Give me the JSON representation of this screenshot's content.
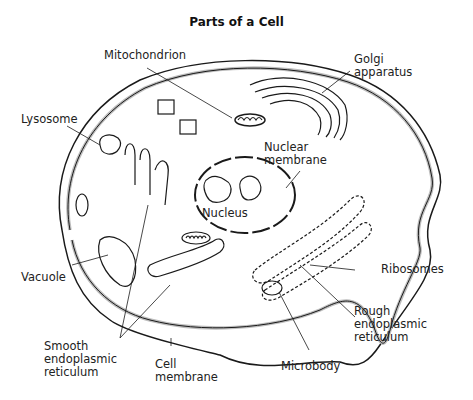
{
  "title": "Parts of a Cell",
  "labels": {
    "mitochondrion": "Mitochondrion",
    "golgi_1": "Golgi",
    "golgi_2": "apparatus",
    "lysosome": "Lysosome",
    "nuclear_membrane_1": "Nuclear",
    "nuclear_membrane_2": "membrane",
    "nucleus": "Nucleus",
    "ribosomes": "Ribosomes",
    "vacuole": "Vacuole",
    "rough_er_1": "Rough",
    "rough_er_2": "endoplasmic",
    "rough_er_3": "reticulum",
    "smooth_er_1": "Smooth",
    "smooth_er_2": "endoplasmic",
    "smooth_er_3": "reticulum",
    "cell_membrane_1": "Cell",
    "cell_membrane_2": "membrane",
    "microbody": "Microbody"
  },
  "colors": {
    "line": "#1a1a1a",
    "membrane_fill": "#bdbdbd",
    "background": "#ffffff"
  }
}
